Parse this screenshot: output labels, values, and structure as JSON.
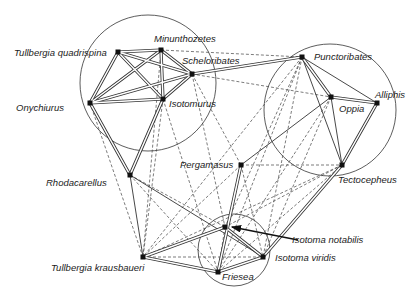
{
  "diagram": {
    "type": "species association network",
    "nodes": [
      {
        "id": "tq",
        "label": "Tullbergia quadrispina",
        "x": 118,
        "y": 52
      },
      {
        "id": "mi",
        "label": "Minunthozetes",
        "x": 161,
        "y": 50
      },
      {
        "id": "sc",
        "label": "Scheloribates",
        "x": 192,
        "y": 74
      },
      {
        "id": "on",
        "label": "Onychiurus",
        "x": 90,
        "y": 103
      },
      {
        "id": "is",
        "label": "Isotomurus",
        "x": 163,
        "y": 99
      },
      {
        "id": "pu",
        "label": "Punctoribates",
        "x": 302,
        "y": 57
      },
      {
        "id": "op",
        "label": "Oppia",
        "x": 331,
        "y": 97
      },
      {
        "id": "al",
        "label": "Alliphis",
        "x": 377,
        "y": 103
      },
      {
        "id": "pe",
        "label": "Pergamasus",
        "x": 241,
        "y": 165
      },
      {
        "id": "te",
        "label": "Tectocepheus",
        "x": 342,
        "y": 165
      },
      {
        "id": "rh",
        "label": "Rhodacarellus",
        "x": 130,
        "y": 175
      },
      {
        "id": "tk",
        "label": "Tullbergia krausbaueri",
        "x": 143,
        "y": 257
      },
      {
        "id": "in",
        "label": "Isotoma notabilis",
        "x": 225,
        "y": 227
      },
      {
        "id": "fr",
        "label": "Friesea",
        "x": 218,
        "y": 272
      },
      {
        "id": "iv",
        "label": "Isotoma viridis",
        "x": 263,
        "y": 257
      }
    ],
    "groups": [
      {
        "name": "left-cluster",
        "cx": 148,
        "cy": 83,
        "r": 68
      },
      {
        "name": "right-cluster",
        "cx": 330,
        "cy": 110,
        "r": 66
      },
      {
        "name": "bottom-cluster",
        "cx": 234,
        "cy": 250,
        "r": 36
      }
    ],
    "edges_double": [
      [
        "tq",
        "mi"
      ],
      [
        "tq",
        "sc"
      ],
      [
        "tq",
        "on"
      ],
      [
        "tq",
        "is"
      ],
      [
        "mi",
        "sc"
      ],
      [
        "mi",
        "on"
      ],
      [
        "mi",
        "is"
      ],
      [
        "sc",
        "on"
      ],
      [
        "sc",
        "is"
      ],
      [
        "on",
        "is"
      ],
      [
        "sc",
        "pu"
      ],
      [
        "on",
        "rh"
      ],
      [
        "is",
        "rh"
      ],
      [
        "pu",
        "op"
      ],
      [
        "op",
        "al"
      ],
      [
        "al",
        "te"
      ],
      [
        "pe",
        "fr"
      ],
      [
        "tk",
        "in"
      ],
      [
        "tk",
        "fr"
      ],
      [
        "in",
        "iv"
      ],
      [
        "fr",
        "iv"
      ],
      [
        "iv",
        "te"
      ]
    ],
    "edges_solid": [
      [
        "on",
        "sc"
      ],
      [
        "pu",
        "al"
      ],
      [
        "pu",
        "te"
      ],
      [
        "op",
        "te"
      ],
      [
        "pe",
        "op"
      ],
      [
        "rh",
        "tk"
      ],
      [
        "rh",
        "iv"
      ]
    ],
    "edges_dashed": [
      [
        "mi",
        "pu"
      ],
      [
        "sc",
        "op"
      ],
      [
        "sc",
        "pe"
      ],
      [
        "mi",
        "tk"
      ],
      [
        "is",
        "tk"
      ],
      [
        "on",
        "tk"
      ],
      [
        "is",
        "fr"
      ],
      [
        "sc",
        "in"
      ],
      [
        "pu",
        "in"
      ],
      [
        "pu",
        "fr"
      ],
      [
        "pu",
        "iv"
      ],
      [
        "pu",
        "tk"
      ],
      [
        "op",
        "fr"
      ],
      [
        "op",
        "iv"
      ],
      [
        "pe",
        "te"
      ],
      [
        "pe",
        "tk"
      ],
      [
        "pe",
        "iv"
      ],
      [
        "te",
        "in"
      ],
      [
        "te",
        "fr"
      ],
      [
        "te",
        "tk"
      ],
      [
        "rh",
        "in"
      ],
      [
        "rh",
        "fr"
      ],
      [
        "tk",
        "iv"
      ],
      [
        "in",
        "fr"
      ]
    ],
    "arrow": {
      "label": "Isotoma notabilis",
      "from": [
        298,
        240
      ],
      "to": [
        232,
        227
      ]
    }
  },
  "labels": {
    "tq": "Tullbergia quadrispina",
    "mi": "Minunthozetes",
    "sc": "Scheloribates",
    "on": "Onychiurus",
    "is": "Isotomurus",
    "pu": "Punctoribates",
    "op": "Oppia",
    "al": "Alliphis",
    "pe": "Pergamasus",
    "te": "Tectocepheus",
    "rh": "Rhodacarellus",
    "tk": "Tullbergia krausbaueri",
    "in": "Isotoma notabilis",
    "fr": "Friesea",
    "iv": "Isotoma viridis"
  }
}
